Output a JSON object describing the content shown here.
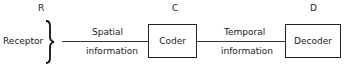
{
  "diagram": {
    "nodes": [
      {
        "id": "R",
        "letter": "R",
        "label": "Receptor"
      },
      {
        "id": "C",
        "letter": "C",
        "label": "Coder"
      },
      {
        "id": "D",
        "letter": "D",
        "label": "Decoder"
      }
    ],
    "edges": [
      {
        "from": "R",
        "to": "C",
        "label_top": "Spatial",
        "label_bottom": "information"
      },
      {
        "from": "C",
        "to": "D",
        "label_top": "Temporal",
        "label_bottom": "information"
      }
    ]
  }
}
